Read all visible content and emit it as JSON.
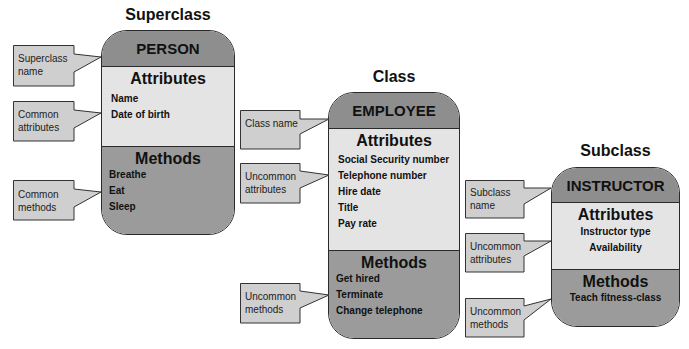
{
  "diagram": {
    "columns": [
      {
        "heading": "Superclass",
        "class_name": "PERSON",
        "attributes_title": "Attributes",
        "attributes": [
          "Name",
          "Date of birth"
        ],
        "methods_title": "Methods",
        "methods": [
          "Breathe",
          "Eat",
          "Sleep"
        ],
        "callouts": {
          "name": "Superclass name",
          "attributes": "Common attributes",
          "methods": "Common methods"
        }
      },
      {
        "heading": "Class",
        "class_name": "EMPLOYEE",
        "attributes_title": "Attributes",
        "attributes": [
          "Social Security number",
          "Telephone number",
          "Hire date",
          "Title",
          "Pay rate"
        ],
        "methods_title": "Methods",
        "methods": [
          "Get hired",
          "Terminate",
          "Change telephone"
        ],
        "callouts": {
          "name": "Class name",
          "attributes": "Uncommon attributes",
          "methods": "Uncommon methods"
        }
      },
      {
        "heading": "Subclass",
        "class_name": "INSTRUCTOR",
        "attributes_title": "Attributes",
        "attributes": [
          "Instructor type",
          "Availability"
        ],
        "methods_title": "Methods",
        "methods": [
          "Teach fitness-class"
        ],
        "callouts": {
          "name": "Subclass name",
          "attributes": "Uncommon attributes",
          "methods": "Uncommon methods"
        }
      }
    ],
    "colors": {
      "header_fill": "#8e8e8e",
      "attributes_fill": "#e4e4e4",
      "methods_fill": "#9b9b9b",
      "callout_fill": "#cfcfcf",
      "outline": "#2a2a2a"
    }
  }
}
